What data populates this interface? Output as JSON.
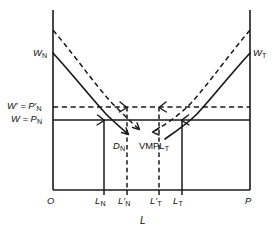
{
  "figure": {
    "type": "economics-diagram",
    "axis_x_label": "L",
    "origin_label": "O",
    "right_endpoint_label": "P"
  },
  "wage_levels": [
    {
      "id": "w-prime",
      "label_lead": "W",
      "label_prime": "′",
      "label_eq": " = ",
      "label_p": "P",
      "label_p_prime": "′",
      "label_sub": "N",
      "line_style": "dashed",
      "y": 107
    },
    {
      "id": "w",
      "label_lead": "W",
      "label_prime": "",
      "label_eq": " = ",
      "label_p": "P",
      "label_p_prime": "",
      "label_sub": "N",
      "line_style": "solid",
      "y": 120
    }
  ],
  "curves": [
    {
      "id": "d-n",
      "label_main": "D",
      "label_sub": "N",
      "style": "solid",
      "orientation": "downward-sloping-from-left"
    },
    {
      "id": "d-n-shifted",
      "label_main": "",
      "label_sub": "",
      "style": "dashed",
      "orientation": "downward-sloping-shifted-out"
    },
    {
      "id": "vmpl-t",
      "label_main": "VMPL",
      "label_sub": "T",
      "style": "solid",
      "orientation": "upward-sloping-to-right"
    },
    {
      "id": "vmpl-t-shifted",
      "label_main": "",
      "label_sub": "",
      "style": "dashed",
      "orientation": "upward-sloping-shifted-left"
    }
  ],
  "axis_endpoint_labels": [
    {
      "id": "w-n",
      "main": "W",
      "sub": "N",
      "position": "top-left"
    },
    {
      "id": "w-t",
      "main": "W",
      "sub": "T",
      "position": "top-right"
    }
  ],
  "x_ticks": [
    {
      "id": "o",
      "main": "O",
      "prime": "",
      "sub": "",
      "x": 53,
      "drop": "none"
    },
    {
      "id": "l-n",
      "main": "L",
      "prime": "",
      "sub": "N",
      "x": 104,
      "drop": "solid"
    },
    {
      "id": "l-n-prime",
      "main": "L",
      "prime": "′",
      "sub": "N",
      "x": 127,
      "drop": "dashed"
    },
    {
      "id": "l-t-prime",
      "main": "L",
      "prime": "′",
      "sub": "T",
      "x": 159,
      "drop": "dashed"
    },
    {
      "id": "l-t",
      "main": "L",
      "prime": "",
      "sub": "T",
      "x": 182,
      "drop": "solid"
    },
    {
      "id": "p",
      "main": "P",
      "prime": "",
      "sub": "",
      "x": 250,
      "drop": "none"
    }
  ],
  "colors": {
    "ink": "#1a1a1a",
    "background": "#ffffff"
  }
}
